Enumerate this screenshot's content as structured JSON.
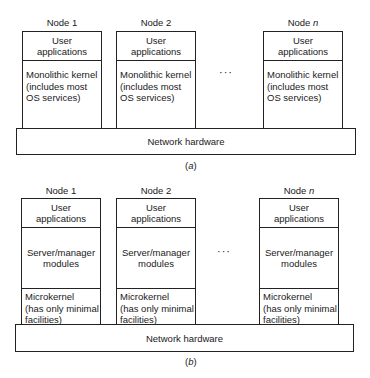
{
  "figure_a": {
    "nodes": [
      {
        "label": "Node 1",
        "top_layer": "User\napplications",
        "kernel": "Monolithic kernel\n(includes most\nOS services)"
      },
      {
        "label": "Node 2",
        "top_layer": "User\napplications",
        "kernel": "Monolithic kernel\n(includes most\nOS services)"
      },
      {
        "label": "Node n",
        "label_prefix": "Node ",
        "label_var": "n",
        "top_layer": "User\napplications",
        "kernel": "Monolithic kernel\n(includes most\nOS services)"
      }
    ],
    "ellipsis": "···",
    "network": "Network hardware",
    "caption_letter": "a"
  },
  "figure_b": {
    "nodes": [
      {
        "label": "Node 1",
        "top_layer": "User\napplications",
        "middle_layer": "Server/manager\nmodules",
        "kernel": "Microkernel\n(has only minimal\nfacilities)"
      },
      {
        "label": "Node 2",
        "top_layer": "User\napplications",
        "middle_layer": "Server/manager\nmodules",
        "kernel": "Microkernel\n(has only minimal\nfacilities)"
      },
      {
        "label": "Node n",
        "label_prefix": "Node ",
        "label_var": "n",
        "top_layer": "User\napplications",
        "middle_layer": "Server/manager\nmodules",
        "kernel": "Microkernel\n(has only minimal\nfacilities)"
      }
    ],
    "ellipsis": "···",
    "network": "Network hardware",
    "caption_letter": "b"
  }
}
